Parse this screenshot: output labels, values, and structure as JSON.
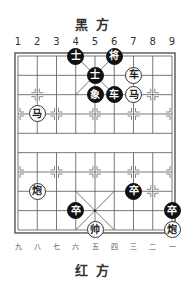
{
  "top_title": "黑方",
  "bottom_title": "红方",
  "top_labels": [
    "1",
    "2",
    "3",
    "4",
    "5",
    "6",
    "7",
    "8",
    "9"
  ],
  "bottom_labels": [
    "九",
    "八",
    "七",
    "六",
    "五",
    "四",
    "三",
    "二",
    "一"
  ],
  "colors": {
    "black_piece": "#111111",
    "red_piece_fill": "#ffffff",
    "grid": "#555555"
  },
  "pieces": [
    {
      "side": "black",
      "char": "士",
      "col": 4,
      "row": 1
    },
    {
      "side": "black",
      "char": "将",
      "col": 6,
      "row": 1
    },
    {
      "side": "black",
      "char": "士",
      "col": 5,
      "row": 2
    },
    {
      "side": "red",
      "char": "车",
      "col": 7,
      "row": 2
    },
    {
      "side": "black",
      "char": "象",
      "col": 5,
      "row": 3
    },
    {
      "side": "black",
      "char": "车",
      "col": 6,
      "row": 3
    },
    {
      "side": "red",
      "char": "马",
      "col": 7,
      "row": 3
    },
    {
      "side": "red",
      "char": "马",
      "col": 2,
      "row": 4
    },
    {
      "side": "red",
      "char": "炮",
      "col": 2,
      "row": 8
    },
    {
      "side": "black",
      "char": "卒",
      "col": 7,
      "row": 8
    },
    {
      "side": "black",
      "char": "卒",
      "col": 4,
      "row": 9
    },
    {
      "side": "black",
      "char": "卒",
      "col": 9,
      "row": 9
    },
    {
      "side": "red",
      "char": "帅",
      "col": 5,
      "row": 10
    },
    {
      "side": "red",
      "char": "炮",
      "col": 9,
      "row": 10
    }
  ]
}
